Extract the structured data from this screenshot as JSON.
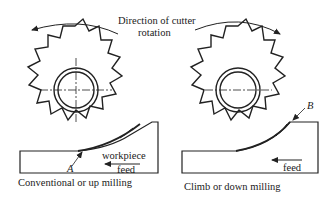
{
  "title": {
    "line1": "Direction of cutter",
    "line2": "rotation"
  },
  "left_panel": {
    "caption": "Conventional or up milling",
    "workpiece_label": "workpiece",
    "feed_label": "feed",
    "point_label": "A",
    "rotation": "counterclockwise"
  },
  "right_panel": {
    "caption": "Climb or down milling",
    "feed_label": "feed",
    "point_label": "B",
    "rotation": "clockwise"
  }
}
